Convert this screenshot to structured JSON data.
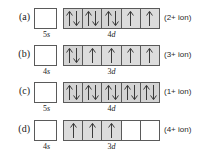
{
  "figure": {
    "background_color": "#ffffff",
    "box_fill_color": "#dcdcdc",
    "box_empty_color": "#ffffff",
    "box_border_color": "#5a5a5a",
    "rows": [
      {
        "key": "a",
        "row_label": "(a)",
        "s_orbital": {
          "label_prefix": "5",
          "label_suffix": "s",
          "electrons": ""
        },
        "d_orbital": {
          "label_prefix": "4",
          "label_suffix": "d",
          "cells": [
            "updown",
            "updown",
            "updown",
            "up",
            "up"
          ]
        },
        "ion_label": "(2+ ion)"
      },
      {
        "key": "b",
        "row_label": "(b)",
        "s_orbital": {
          "label_prefix": "4",
          "label_suffix": "s",
          "electrons": ""
        },
        "d_orbital": {
          "label_prefix": "3",
          "label_suffix": "d",
          "cells": [
            "updown",
            "up",
            "up",
            "up",
            "up"
          ]
        },
        "ion_label": "(3+ ion)"
      },
      {
        "key": "c",
        "row_label": "(c)",
        "s_orbital": {
          "label_prefix": "5",
          "label_suffix": "s",
          "electrons": ""
        },
        "d_orbital": {
          "label_prefix": "4",
          "label_suffix": "d",
          "cells": [
            "updown",
            "updown",
            "updown",
            "updown",
            "updown"
          ]
        },
        "ion_label": "(1+ ion)"
      },
      {
        "key": "d",
        "row_label": "(d)",
        "s_orbital": {
          "label_prefix": "4",
          "label_suffix": "s",
          "electrons": ""
        },
        "d_orbital": {
          "label_prefix": "3",
          "label_suffix": "d",
          "cells": [
            "up",
            "up",
            "up",
            "none",
            "none"
          ]
        },
        "ion_label": "(4+ ion)"
      }
    ]
  }
}
